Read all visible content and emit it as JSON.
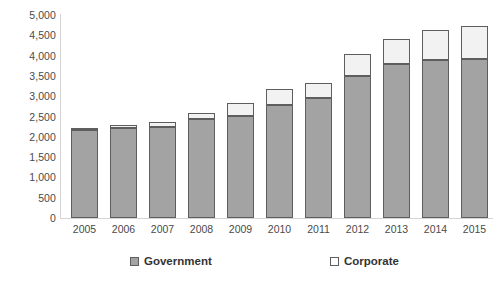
{
  "chart_data": {
    "type": "bar",
    "subtype": "stacked-column",
    "title": "",
    "xlabel": "",
    "ylabel": "",
    "categories": [
      "2005",
      "2006",
      "2007",
      "2008",
      "2009",
      "2010",
      "2011",
      "2012",
      "2013",
      "2014",
      "2015"
    ],
    "series": [
      {
        "name": "Government",
        "color": "#a3a3a3",
        "values": [
          2180,
          2220,
          2240,
          2450,
          2520,
          2780,
          2950,
          3500,
          3800,
          3880,
          3920
        ]
      },
      {
        "name": "Corporate",
        "color": "#ffffff",
        "values": [
          40,
          70,
          120,
          140,
          320,
          400,
          380,
          550,
          600,
          740,
          800
        ]
      }
    ],
    "totals": [
      2220,
      2290,
      2360,
      2590,
      2840,
      3180,
      3330,
      4050,
      4400,
      4620,
      4720
    ],
    "ylim": [
      0,
      5000
    ],
    "ytick_step": 500,
    "ytick_labels": [
      "0",
      "500",
      "1,000",
      "1,500",
      "2,000",
      "2,500",
      "3,000",
      "3,500",
      "4,000",
      "4,500",
      "5,000"
    ],
    "ytick_values": [
      0,
      500,
      1000,
      1500,
      2000,
      2500,
      3000,
      3500,
      4000,
      4500,
      5000
    ],
    "grid": false,
    "legend_position": "bottom",
    "legend": [
      {
        "label": "Government",
        "swatch": "filled-gray"
      },
      {
        "label": "Corporate",
        "swatch": "empty-white"
      }
    ]
  }
}
